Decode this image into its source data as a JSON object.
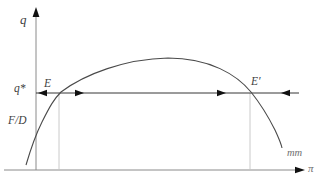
{
  "figure": {
    "axes": {
      "y_label": "q",
      "x_label": "π"
    },
    "labels": {
      "y_value": "q*",
      "intercept": "F/D",
      "equilibrium_left": "E",
      "equilibrium_right": "E′",
      "curve": "mm"
    },
    "colors": {
      "background": "#ffffff",
      "axis": "#8a8a8a",
      "curve": "#4a4a4a",
      "guide_line": "#1f1f1f",
      "arrow": "#111111",
      "dropline": "#c4c4c4",
      "label": "#3f3f3f",
      "label_muted": "#6f6f6f"
    }
  }
}
